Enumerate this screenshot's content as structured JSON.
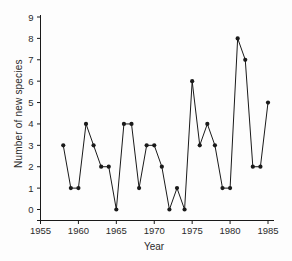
{
  "chart_data": {
    "type": "line",
    "xlabel": "Year",
    "ylabel": "Number of new species",
    "x": [
      1958,
      1959,
      1960,
      1961,
      1962,
      1963,
      1964,
      1965,
      1966,
      1967,
      1968,
      1969,
      1970,
      1971,
      1972,
      1973,
      1974,
      1975,
      1976,
      1977,
      1978,
      1979,
      1980,
      1981,
      1982,
      1983,
      1984,
      1985
    ],
    "values": [
      3,
      1,
      1,
      4,
      3,
      2,
      2,
      0,
      4,
      4,
      1,
      3,
      3,
      2,
      0,
      1,
      0,
      6,
      3,
      4,
      3,
      1,
      1,
      8,
      7,
      2,
      2,
      5
    ],
    "xlim": [
      1955,
      1985
    ],
    "ylim": [
      0,
      9
    ],
    "xticks": [
      1955,
      1960,
      1965,
      1970,
      1975,
      1980,
      1985
    ],
    "yticks": [
      0,
      1,
      2,
      3,
      4,
      5,
      6,
      7,
      8,
      9
    ],
    "grid": false,
    "legend": "none",
    "marker": "filled-circle",
    "line_color": "#1a1a1a",
    "marker_color": "#1a1a1a",
    "tick_label_color": "#2b2b2b",
    "background": "#fdfdfd"
  }
}
